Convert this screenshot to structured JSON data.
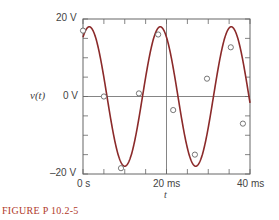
{
  "chart_data": {
    "type": "line",
    "title": "",
    "xlabel": "t",
    "ylabel": "v(t)",
    "xlim": [
      0,
      40
    ],
    "ylim": [
      -20,
      20
    ],
    "x_unit": "ms",
    "y_unit": "V",
    "x_ticks": [
      0,
      5,
      10,
      15,
      20,
      25,
      30,
      35,
      40
    ],
    "x_tick_labels": [
      "0 s",
      "20 ms",
      "40 ms"
    ],
    "y_ticks": [
      -20,
      -15,
      -10,
      -5,
      0,
      5,
      10,
      15,
      20
    ],
    "y_tick_labels": [
      "20 V",
      "0 V",
      "-20 V"
    ],
    "grid": false,
    "series": [
      {
        "name": "v(t) sinusoid",
        "kind": "curve",
        "color": "#8b2a2a",
        "amplitude": 18,
        "period_ms": 17,
        "peak_time_ms": 1.5
      },
      {
        "name": "measured points",
        "kind": "markers",
        "x": [
          0,
          5,
          9.1,
          13.4,
          18,
          21.6,
          26.8,
          29.7,
          35.4,
          38.3
        ],
        "y": [
          17,
          0,
          -18.5,
          0.8,
          16,
          -3.5,
          -15,
          4.6,
          12.7,
          -7
        ]
      }
    ]
  },
  "labels": {
    "y_top": "20 V",
    "y_mid": "0 V",
    "y_bottom": "–20 V",
    "ylabel": "v(t)",
    "x_left": "0 s",
    "x_mid": "20 ms",
    "x_right": "40 ms",
    "xlabel": "t",
    "caption_prefix": "FIGURE",
    "caption_id": "P 10.2-5"
  },
  "colors": {
    "curve": "#8b2a2a",
    "axis": "#666666",
    "caption": "#b13a2a"
  }
}
